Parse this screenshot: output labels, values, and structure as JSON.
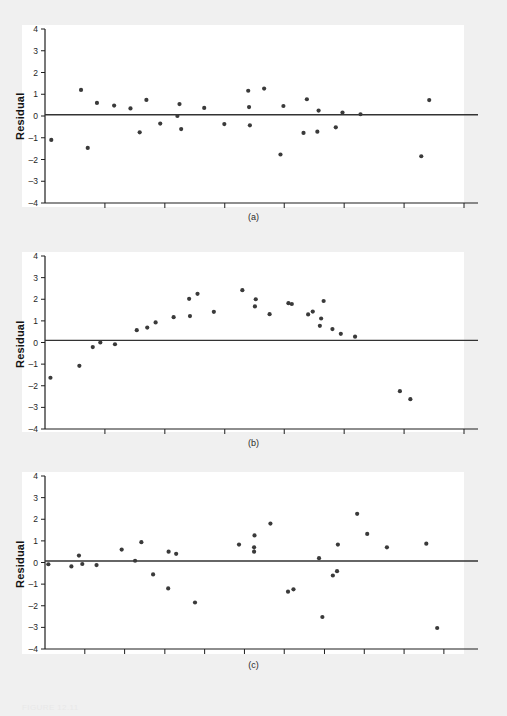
{
  "figure": {
    "background_color": "#f0f0f0",
    "panel_background_color": "#ffffff",
    "point_color": "#3a3a3a",
    "axis_color": "#1e1e1e",
    "caption": "FIGURE 12.11"
  },
  "panels": [
    {
      "caption": "(a)",
      "ylabel": "Residual"
    },
    {
      "caption": "(b)",
      "ylabel": "Residual"
    },
    {
      "caption": "(c)",
      "ylabel": "Residual"
    }
  ],
  "chart_data": [
    {
      "type": "scatter",
      "title": "(a)",
      "xlabel": "",
      "ylabel": "Residual",
      "ylim": [
        -4,
        4
      ],
      "xlim": [
        0,
        100
      ],
      "yticks": [
        4,
        3,
        2,
        1,
        0,
        -1,
        -2,
        -3,
        -4
      ],
      "ytick_labels": [
        "4",
        "3",
        "2",
        "1",
        "0",
        "-1",
        "-2",
        "-3",
        "-4"
      ],
      "xticks": [
        0,
        14.3,
        28.6,
        42.9,
        57.1,
        71.4,
        85.7,
        100
      ],
      "xtick_labels": [
        "",
        "",
        "",
        "",
        "",
        "",
        "",
        ""
      ],
      "grid": false,
      "legend": "none",
      "reference_line": {
        "type": "horizontal",
        "y": 0.06,
        "label": "zero-residual-line"
      },
      "points": [
        {
          "x": 1.5,
          "y": -1.1
        },
        {
          "x": 8.6,
          "y": 1.2
        },
        {
          "x": 12.4,
          "y": 0.6
        },
        {
          "x": 16.5,
          "y": 0.48
        },
        {
          "x": 20.4,
          "y": 0.35
        },
        {
          "x": 22.6,
          "y": -0.75
        },
        {
          "x": 24.2,
          "y": 0.74
        },
        {
          "x": 27.5,
          "y": -0.35
        },
        {
          "x": 31.6,
          "y": 0.0
        },
        {
          "x": 32.1,
          "y": 0.55
        },
        {
          "x": 32.5,
          "y": -0.6
        },
        {
          "x": 10.2,
          "y": -1.47
        },
        {
          "x": 38.0,
          "y": 0.37
        },
        {
          "x": 42.8,
          "y": -0.37
        },
        {
          "x": 48.5,
          "y": 1.16
        },
        {
          "x": 48.7,
          "y": 0.41
        },
        {
          "x": 48.9,
          "y": -0.43
        },
        {
          "x": 52.3,
          "y": 1.26
        },
        {
          "x": 56.9,
          "y": 0.46
        },
        {
          "x": 56.2,
          "y": -1.77
        },
        {
          "x": 62.5,
          "y": 0.77
        },
        {
          "x": 61.7,
          "y": -0.78
        },
        {
          "x": 65.3,
          "y": 0.25
        },
        {
          "x": 65.0,
          "y": -0.72
        },
        {
          "x": 69.4,
          "y": -0.52
        },
        {
          "x": 71.0,
          "y": 0.16
        },
        {
          "x": 75.3,
          "y": 0.08
        },
        {
          "x": 91.7,
          "y": 0.73
        },
        {
          "x": 89.8,
          "y": -1.85
        }
      ]
    },
    {
      "type": "scatter",
      "title": "(b)",
      "xlabel": "",
      "ylabel": "Residual",
      "ylim": [
        -4,
        4
      ],
      "xlim": [
        0,
        100
      ],
      "yticks": [
        4,
        3,
        2,
        1,
        0,
        -1,
        -2,
        -3,
        -4
      ],
      "ytick_labels": [
        "4",
        "3",
        "2",
        "1",
        "0",
        "-1",
        "-2",
        "-3",
        "-4"
      ],
      "xticks": [
        0,
        14.3,
        28.6,
        42.9,
        57.1,
        71.4,
        85.7,
        100
      ],
      "xtick_labels": [
        "",
        "",
        "",
        "",
        "",
        "",
        "",
        ""
      ],
      "grid": false,
      "legend": "none",
      "reference_line": {
        "type": "horizontal",
        "y": 0.1,
        "label": "zero-residual-line"
      },
      "points": [
        {
          "x": 1.3,
          "y": -1.63
        },
        {
          "x": 8.2,
          "y": -1.08
        },
        {
          "x": 11.4,
          "y": -0.21
        },
        {
          "x": 13.2,
          "y": 0.0
        },
        {
          "x": 16.7,
          "y": -0.08
        },
        {
          "x": 21.9,
          "y": 0.57
        },
        {
          "x": 24.4,
          "y": 0.69
        },
        {
          "x": 26.4,
          "y": 0.93
        },
        {
          "x": 30.7,
          "y": 1.17
        },
        {
          "x": 34.4,
          "y": 2.02
        },
        {
          "x": 34.6,
          "y": 1.22
        },
        {
          "x": 36.4,
          "y": 2.25
        },
        {
          "x": 40.3,
          "y": 1.42
        },
        {
          "x": 47.1,
          "y": 2.42
        },
        {
          "x": 50.3,
          "y": 2.0
        },
        {
          "x": 50.1,
          "y": 1.67
        },
        {
          "x": 53.6,
          "y": 1.31
        },
        {
          "x": 58.1,
          "y": 1.82
        },
        {
          "x": 58.9,
          "y": 1.78
        },
        {
          "x": 62.8,
          "y": 1.3
        },
        {
          "x": 63.9,
          "y": 1.43
        },
        {
          "x": 66.5,
          "y": 1.92
        },
        {
          "x": 65.9,
          "y": 1.11
        },
        {
          "x": 65.6,
          "y": 0.77
        },
        {
          "x": 68.6,
          "y": 0.62
        },
        {
          "x": 70.6,
          "y": 0.4
        },
        {
          "x": 74.0,
          "y": 0.27
        },
        {
          "x": 84.7,
          "y": -2.25
        },
        {
          "x": 87.2,
          "y": -2.62
        }
      ]
    },
    {
      "type": "scatter",
      "title": "(c)",
      "xlabel": "",
      "ylabel": "Residual",
      "ylim": [
        -4,
        4
      ],
      "xlim": [
        0,
        100
      ],
      "yticks": [
        4,
        3,
        2,
        1,
        0,
        -1,
        -2,
        -3,
        -4
      ],
      "ytick_labels": [
        "4",
        "3",
        "2",
        "1",
        "0",
        "-1",
        "-2",
        "-3",
        "-4"
      ],
      "xticks": [
        0,
        9.5,
        19.0,
        28.6,
        38.1,
        47.6,
        57.1,
        66.7,
        76.2,
        85.7,
        95.2
      ],
      "xtick_labels": [
        "",
        "",
        "",
        "",
        "",
        "",
        "",
        "",
        "",
        "",
        ""
      ],
      "grid": false,
      "legend": "none",
      "reference_line": {
        "type": "horizontal",
        "y": 0.07,
        "label": "zero-residual-line"
      },
      "points": [
        {
          "x": 0.8,
          "y": -0.08
        },
        {
          "x": 6.3,
          "y": -0.18
        },
        {
          "x": 8.1,
          "y": 0.32
        },
        {
          "x": 8.9,
          "y": -0.07
        },
        {
          "x": 12.3,
          "y": -0.12
        },
        {
          "x": 18.3,
          "y": 0.6
        },
        {
          "x": 21.5,
          "y": 0.08
        },
        {
          "x": 23.0,
          "y": 0.94
        },
        {
          "x": 25.8,
          "y": -0.55
        },
        {
          "x": 29.5,
          "y": 0.5
        },
        {
          "x": 29.4,
          "y": -1.2
        },
        {
          "x": 31.3,
          "y": 0.4
        },
        {
          "x": 35.8,
          "y": -1.85
        },
        {
          "x": 46.3,
          "y": 0.83
        },
        {
          "x": 50.0,
          "y": 1.25
        },
        {
          "x": 49.9,
          "y": 0.7
        },
        {
          "x": 49.9,
          "y": 0.5
        },
        {
          "x": 53.8,
          "y": 1.8
        },
        {
          "x": 58.0,
          "y": -1.35
        },
        {
          "x": 59.3,
          "y": -1.24
        },
        {
          "x": 65.4,
          "y": 0.2
        },
        {
          "x": 66.2,
          "y": -2.52
        },
        {
          "x": 68.7,
          "y": -0.6
        },
        {
          "x": 69.7,
          "y": -0.4
        },
        {
          "x": 69.9,
          "y": 0.83
        },
        {
          "x": 74.5,
          "y": 2.25
        },
        {
          "x": 76.9,
          "y": 1.32
        },
        {
          "x": 81.6,
          "y": 0.7
        },
        {
          "x": 91.0,
          "y": 0.87
        },
        {
          "x": 93.6,
          "y": -3.03
        }
      ]
    }
  ]
}
